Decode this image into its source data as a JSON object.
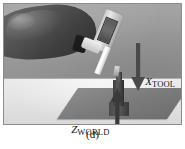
{
  "figure": {
    "caption": "(d)",
    "photo_description": "Grayscale photograph of a gloved hand holding a handheld tool angled downward toward a dark cylindrical workpiece standing on a dark base plate on a light table, against a gray wall.",
    "annotations": [
      {
        "id": "x-tool",
        "symbol": "X",
        "subscript": "TOOL",
        "direction": "down",
        "arrow_color": "#4a4a48",
        "label_color": "#141414"
      },
      {
        "id": "z-world",
        "symbol": "Z",
        "subscript": "WORLD",
        "direction": "up",
        "arrow_color": "#3a3a38",
        "label_color": "#141414"
      }
    ],
    "colors": {
      "page_background": "#ffffff",
      "wall": "#9c9c9c",
      "floor": "#e2e2e0",
      "plate": "#7b7b79",
      "workpiece": "#3e3e3c",
      "glove": "#585856",
      "tool_body": "#e6e6e4",
      "frame_border": "#8d8d8d"
    }
  }
}
